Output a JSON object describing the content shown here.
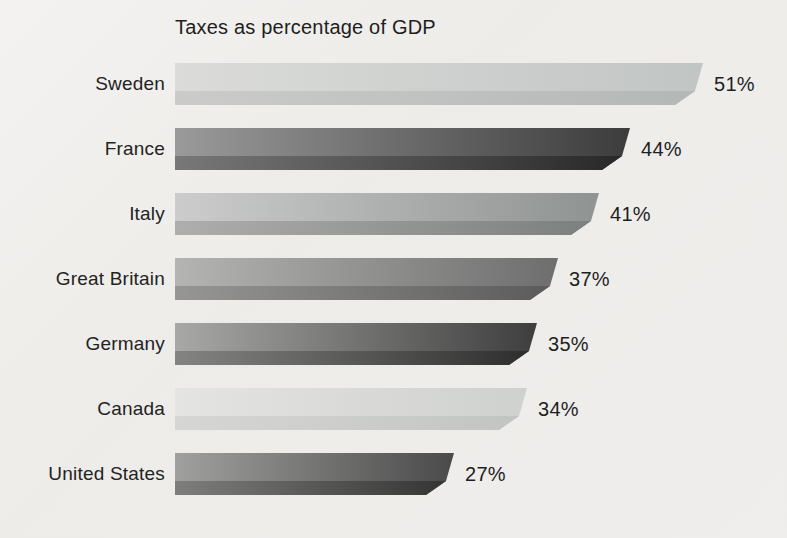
{
  "chart_data": {
    "type": "bar",
    "orientation": "horizontal",
    "title": "Taxes as percentage of GDP",
    "xlabel": "",
    "ylabel": "",
    "categories": [
      "Sweden",
      "France",
      "Italy",
      "Great Britain",
      "Germany",
      "Canada",
      "United States"
    ],
    "values": [
      51,
      44,
      41,
      37,
      35,
      34,
      27
    ],
    "value_labels": [
      "51%",
      "44%",
      "41%",
      "37%",
      "35%",
      "34%",
      "27%"
    ],
    "xlim": [
      0,
      55
    ],
    "grid": false,
    "legend": false,
    "background_color": "#efeeec",
    "text_color": "#1e1e1e",
    "bar_styles": [
      {
        "main_from": "#dbdcda",
        "main_to": "#c1c5c3",
        "shade_from": "#cbccca",
        "shade_to": "#b3b7b5"
      },
      {
        "main_from": "#9a9a9a",
        "main_to": "#3c3c3c",
        "shade_from": "#787878",
        "shade_to": "#272727"
      },
      {
        "main_from": "#cccccc",
        "main_to": "#8f9392",
        "shade_from": "#aeaeac",
        "shade_to": "#7b7f7d"
      },
      {
        "main_from": "#b4b4b2",
        "main_to": "#6e6e6e",
        "shade_from": "#969694",
        "shade_to": "#5a5a5a"
      },
      {
        "main_from": "#a8a8a6",
        "main_to": "#3e3e3e",
        "shade_from": "#848482",
        "shade_to": "#2c2c2c"
      },
      {
        "main_from": "#e4e4e2",
        "main_to": "#cfd1cf",
        "shade_from": "#d6d7d5",
        "shade_to": "#c2c4c2"
      },
      {
        "main_from": "#a0a09e",
        "main_to": "#4a4a4a",
        "shade_from": "#7e7e7c",
        "shade_to": "#323232"
      }
    ],
    "px_per_percent": 10.35,
    "bar_height_px": 42,
    "bar_shade_height_px": 14
  }
}
